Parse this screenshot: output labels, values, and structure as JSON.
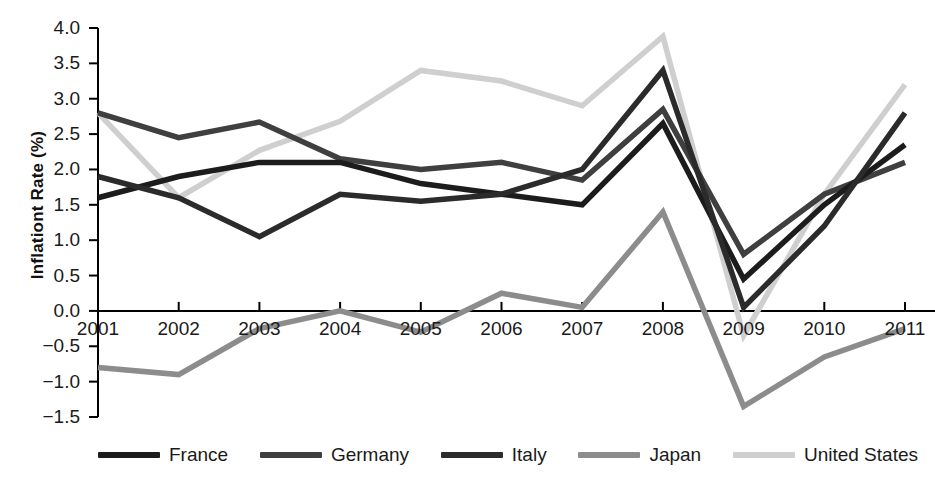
{
  "chart_data": {
    "type": "line",
    "title": "",
    "xlabel": "",
    "ylabel": "Inflationt Rate (%)",
    "x": [
      2001,
      2002,
      2003,
      2004,
      2005,
      2006,
      2007,
      2008,
      2009,
      2010,
      2011
    ],
    "categories": [
      "2001",
      "2002",
      "2003",
      "2004",
      "2005",
      "2006",
      "2007",
      "2008",
      "2009",
      "2010",
      "2011"
    ],
    "xlim": [
      2001,
      2011
    ],
    "ylim": [
      -1.5,
      4.0
    ],
    "ytick_labels": [
      "4.0",
      "3.5",
      "3.0",
      "2.5",
      "2.0",
      "1.5",
      "1.0",
      "0.5",
      "0.0",
      "−0.5",
      "−1.0",
      "−1.5"
    ],
    "ytick_values": [
      4.0,
      3.5,
      3.0,
      2.5,
      2.0,
      1.5,
      1.0,
      0.5,
      0.0,
      -0.5,
      -1.0,
      -1.5
    ],
    "grid": false,
    "legend_position": "bottom",
    "series": [
      {
        "name": "France",
        "color": "#1c1c1c",
        "values": [
          1.6,
          1.9,
          2.1,
          2.1,
          1.8,
          1.65,
          1.5,
          2.65,
          0.45,
          1.5,
          2.35
        ]
      },
      {
        "name": "Germany",
        "color": "#3f3f3f",
        "values": [
          2.8,
          2.45,
          2.67,
          2.15,
          2.0,
          2.1,
          1.85,
          2.85,
          0.8,
          1.65,
          2.1
        ]
      },
      {
        "name": "Italy",
        "color": "#2b2b2b",
        "values": [
          1.9,
          1.6,
          1.05,
          1.65,
          1.55,
          1.65,
          2.0,
          3.4,
          0.05,
          1.2,
          2.8
        ]
      },
      {
        "name": "Japan",
        "color": "#8c8c8c",
        "values": [
          -0.8,
          -0.9,
          -0.25,
          0.0,
          -0.3,
          0.25,
          0.05,
          1.4,
          -1.35,
          -0.65,
          -0.25
        ]
      },
      {
        "name": "United States",
        "color": "#cfcfcf",
        "values": [
          2.8,
          1.6,
          2.27,
          2.68,
          3.4,
          3.25,
          2.9,
          3.88,
          -0.35,
          1.65,
          3.2
        ]
      }
    ]
  }
}
